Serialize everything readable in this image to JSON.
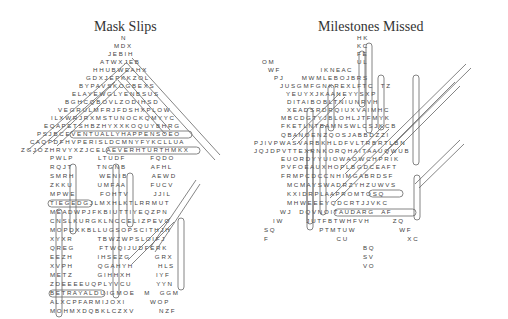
{
  "puzzles": [
    {
      "title": "Mask Slips",
      "rows": [
        {
          "x": 121,
          "y": 38,
          "text": "N"
        },
        {
          "x": 114,
          "y": 46,
          "text": "M D X"
        },
        {
          "x": 108,
          "y": 54,
          "text": "J E B I H"
        },
        {
          "x": 100,
          "y": 62,
          "text": "A T W X J E B"
        },
        {
          "x": 93,
          "y": 70,
          "text": "H H U B W E A H X"
        },
        {
          "x": 86,
          "y": 78,
          "text": "G D X J E P K K Z O L"
        },
        {
          "x": 79,
          "y": 86,
          "text": "B Y P A V S K O G B E X S"
        },
        {
          "x": 72,
          "y": 94,
          "text": "E L A Y E W G L Y E N B S U S"
        },
        {
          "x": 65,
          "y": 102,
          "text": "B G H C Q B O V L Z O D I H S D"
        },
        {
          "x": 58,
          "y": 110,
          "text": "V E G R U L M F R J F D S H X P L O W"
        },
        {
          "x": 51,
          "y": 118,
          "text": "I L X W R J R X M S T U N O C K Q M Y Y C"
        },
        {
          "x": 44,
          "y": 126,
          "text": "E Q A P E T S H B Z H Y X X K O Q U Y B H R G"
        },
        {
          "x": 37,
          "y": 134,
          "text": "P S J B C E V E N T U A L L Y H A P P E N S O E O"
        },
        {
          "x": 30,
          "y": 142,
          "text": "C A Q P D F H V P E R I S L D C M N Y F Y K C L L U A"
        },
        {
          "x": 21,
          "y": 150,
          "text": "Z G J O Z H R V Y X Z J C E L A E V E R H T U R T H M K X"
        },
        {
          "x": 50,
          "y": 158,
          "text": "P W L P               L T U D F               F Q D O"
        },
        {
          "x": 50,
          "y": 167,
          "text": "R Q J T               T N G N B               A F H L"
        },
        {
          "x": 50,
          "y": 176,
          "text": "S M R H               W E N I B               A E W D"
        },
        {
          "x": 50,
          "y": 185,
          "text": "Z K K U               U M F A A               F U C V"
        },
        {
          "x": 50,
          "y": 194,
          "text": "M P W E               F O H T V               J J I L"
        },
        {
          "x": 50,
          "y": 203,
          "text": "T I E G E D G J L M X H L K T L R R M U T"
        },
        {
          "x": 50,
          "y": 212,
          "text": "M E A D W P J F K B I U T T I Y E Q Z P N"
        },
        {
          "x": 50,
          "y": 221,
          "text": "C N S L K U R G K L N C C E L I Z P E V O"
        },
        {
          "x": 50,
          "y": 230,
          "text": "M O P D X K B L L U G S O P S C I T H J H"
        },
        {
          "x": 50,
          "y": 239,
          "text": "X Y X R               T B W Z W P S L O I F J"
        },
        {
          "x": 50,
          "y": 248,
          "text": "Q R E G               F T W Q I J U D F E R K"
        },
        {
          "x": 50,
          "y": 257,
          "text": "E E Z H               I H S E Z G               G R X"
        },
        {
          "x": 50,
          "y": 266,
          "text": "X V P H               Q G A H Y H               H L S"
        },
        {
          "x": 50,
          "y": 275,
          "text": "M E T Z               G I H H X H               I Y F"
        },
        {
          "x": 50,
          "y": 284,
          "text": "Z D E E E E U Q P L Y V C U               Y Y N"
        },
        {
          "x": 50,
          "y": 293,
          "text": "B E T R A Y A L D U I G M O E      M      G G M"
        },
        {
          "x": 50,
          "y": 302,
          "text": "A L X C P F A R M I J O X I               W O P"
        },
        {
          "x": 50,
          "y": 311,
          "text": "M O H M X D Q B K L C Z X V               N Z F"
        }
      ],
      "extra_rows": [
        {
          "x": 50,
          "y": 320,
          "text": "M O S X Z Q A X P M M O H E               F D O"
        },
        {
          "x": 50,
          "y": 329,
          "text": "M U J A Z Y E P E M X W C Z               P X A"
        }
      ],
      "found_words": [
        "EVENTUALLYHAPPENS",
        "DELAEVERHTURT",
        "TIEGED",
        "BETRAYAL"
      ]
    },
    {
      "title": "Milestones Missed",
      "rows": [
        {
          "x": 357,
          "y": 38,
          "text": "H K"
        },
        {
          "x": 357,
          "y": 46,
          "text": "K C"
        },
        {
          "x": 357,
          "y": 54,
          "text": "F E"
        },
        {
          "x": 262,
          "y": 62,
          "text": "O M"
        },
        {
          "x": 357,
          "y": 62,
          "text": "U L"
        },
        {
          "x": 268,
          "y": 70,
          "text": "W F                        I K N E A C"
        },
        {
          "x": 274,
          "y": 78,
          "text": "P J           M W M L E B O J B R S"
        },
        {
          "x": 280,
          "y": 86,
          "text": "J U S G M F G N K R E X L F T C     T Z"
        },
        {
          "x": 286,
          "y": 94,
          "text": "Y E U Y X J K A A N E Y Y S X P"
        },
        {
          "x": 287,
          "y": 102,
          "text": "D I T A I B O B L T N I U N R V H"
        },
        {
          "x": 287,
          "y": 110,
          "text": "X E A D S R D R Q I U X V A I M H C"
        },
        {
          "x": 281,
          "y": 118,
          "text": "M B C D G T Y J B L O H L J T F M Y K"
        },
        {
          "x": 281,
          "y": 126,
          "text": "F K E T L N T B A M N S W L C S J K C B"
        },
        {
          "x": 281,
          "y": 135,
          "text": "Q B A N O E N Z Q O S J A B B D Z Z I"
        },
        {
          "x": 254,
          "y": 143,
          "text": "P J I V P W A S V A R B K H L D F V L T R B R T L B N"
        },
        {
          "x": 254,
          "y": 151,
          "text": "J Q J D P V T T E X R N K O R Q H A I T A A U Q W U B"
        },
        {
          "x": 281,
          "y": 159,
          "text": "E U O R D Y Y U I O W A O W C H P R I K"
        },
        {
          "x": 281,
          "y": 167,
          "text": "P V F O E A U X H O P L B G D C E A F T"
        },
        {
          "x": 281,
          "y": 176,
          "text": "F R M P C D C C N H I M G A B R D S F"
        },
        {
          "x": 287,
          "y": 185,
          "text": "M C M A Y S W A D R Z Y H Z U W V S"
        },
        {
          "x": 287,
          "y": 194,
          "text": "K X I D R P L A A P R O M T O S Q"
        },
        {
          "x": 287,
          "y": 203,
          "text": "M H W E E E Y Q D C R T J J V K C"
        },
        {
          "x": 280,
          "y": 212,
          "text": "W J     D Q V N O I T A U D A R G     A F"
        },
        {
          "x": 273,
          "y": 221,
          "text": "I W              J U T F B T W H F V H              Z Q"
        },
        {
          "x": 264,
          "y": 230,
          "text": "S Q                          P T M T U W                          W F"
        },
        {
          "x": 264,
          "y": 239,
          "text": "F                                        C U                                   X C"
        },
        {
          "x": 363,
          "y": 248,
          "text": "B Q"
        },
        {
          "x": 363,
          "y": 257,
          "text": "S V"
        },
        {
          "x": 363,
          "y": 266,
          "text": "V O"
        }
      ],
      "found_words": [
        "FUNERAL",
        "CELEBRATION",
        "PROM",
        "GRADUATION"
      ]
    }
  ],
  "colors": {
    "text": "#444444",
    "title": "#333333",
    "highlight_stroke": "#555555",
    "background": "#ffffff"
  }
}
